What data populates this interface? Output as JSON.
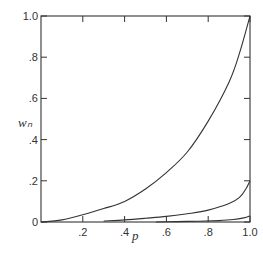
{
  "chart_data": {
    "type": "line",
    "title": "",
    "xlabel": "p",
    "ylabel": "w_n",
    "xlim": [
      0,
      1.0
    ],
    "ylim": [
      0,
      1.0
    ],
    "grid": false,
    "legend": null,
    "x_ticks": [
      {
        "value": 0.2,
        "label": ".2"
      },
      {
        "value": 0.4,
        "label": ".4"
      },
      {
        "value": 0.6,
        "label": ".6"
      },
      {
        "value": 0.8,
        "label": ".8"
      },
      {
        "value": 1.0,
        "label": "1.0"
      }
    ],
    "y_ticks": [
      {
        "value": 0,
        "label": "0"
      },
      {
        "value": 0.2,
        "label": ".2"
      },
      {
        "value": 0.4,
        "label": ".4"
      },
      {
        "value": 0.6,
        "label": ".6"
      },
      {
        "value": 0.8,
        "label": ".8"
      },
      {
        "value": 1.0,
        "label": "1.0"
      }
    ],
    "series": [
      {
        "name": "upper curve",
        "x": [
          0.0,
          0.1,
          0.2,
          0.3,
          0.4,
          0.5,
          0.6,
          0.7,
          0.8,
          0.9,
          0.95,
          1.0
        ],
        "y": [
          0.0,
          0.01,
          0.035,
          0.065,
          0.1,
          0.16,
          0.24,
          0.34,
          0.49,
          0.68,
          0.82,
          1.0
        ]
      },
      {
        "name": "middle curve",
        "x": [
          0.3,
          0.4,
          0.5,
          0.6,
          0.7,
          0.8,
          0.9,
          0.95,
          0.98,
          1.0
        ],
        "y": [
          0.005,
          0.01,
          0.018,
          0.027,
          0.04,
          0.058,
          0.09,
          0.12,
          0.16,
          0.2
        ]
      },
      {
        "name": "lower curve",
        "x": [
          0.55,
          0.65,
          0.75,
          0.85,
          0.92,
          0.97,
          1.0
        ],
        "y": [
          0.0,
          0.002,
          0.004,
          0.007,
          0.012,
          0.02,
          0.03
        ]
      }
    ]
  }
}
